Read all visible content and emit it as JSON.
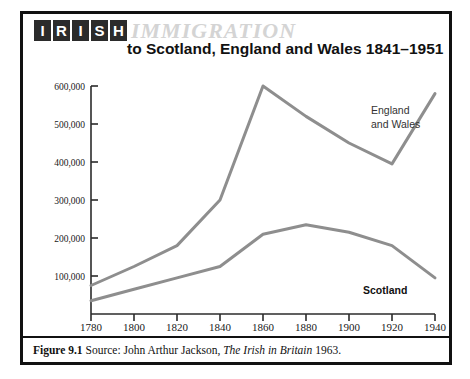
{
  "figure": {
    "wordmark_letters": [
      "I",
      "R",
      "I",
      "S",
      "H"
    ],
    "wordmark_text": "IRISH",
    "overline_word": "IMMIGRATION",
    "subtitle": "to Scotland, England and Wales 1841–1951",
    "caption": {
      "figure_number": "Figure 9.1",
      "source_prefix": " Source: John Arthur Jackson, ",
      "work_title": "The Irish in Britain",
      "year_suffix": " 1963."
    }
  },
  "colors": {
    "border": "#111111",
    "wordmark_tile": "#2b2b2b",
    "wordmark_letter": "#ffffff",
    "overline_word": "#d4d4d4",
    "series_line": "#8e8e8e",
    "axis": "#2b2b2b",
    "text": "#111111",
    "background": "#ffffff"
  },
  "chart_data": {
    "type": "line",
    "xlabel": "",
    "ylabel": "",
    "x": [
      1780,
      1800,
      1820,
      1840,
      1860,
      1880,
      1900,
      1920,
      1940
    ],
    "xtick_labels": [
      "1780",
      "1800",
      "1820",
      "1840",
      "1860",
      "1880",
      "1900",
      "1920",
      "1940"
    ],
    "ytick_values": [
      100000,
      200000,
      300000,
      400000,
      500000,
      600000
    ],
    "ytick_labels": [
      "100,000",
      "200,000",
      "300,000",
      "400,000",
      "500,000",
      "600,000"
    ],
    "xlim": [
      1780,
      1940
    ],
    "ylim": [
      0,
      640000
    ],
    "grid": false,
    "legend": "inline-annotations",
    "series": [
      {
        "name": "England and Wales",
        "label_lines": [
          "England",
          "and Wales"
        ],
        "color": "#8e8e8e",
        "values": [
          75000,
          125000,
          180000,
          300000,
          600000,
          520000,
          450000,
          395000,
          580000
        ]
      },
      {
        "name": "Scotland",
        "label_lines": [
          "Scotland"
        ],
        "color": "#8e8e8e",
        "values": [
          35000,
          65000,
          95000,
          125000,
          210000,
          235000,
          215000,
          180000,
          95000
        ]
      }
    ]
  }
}
